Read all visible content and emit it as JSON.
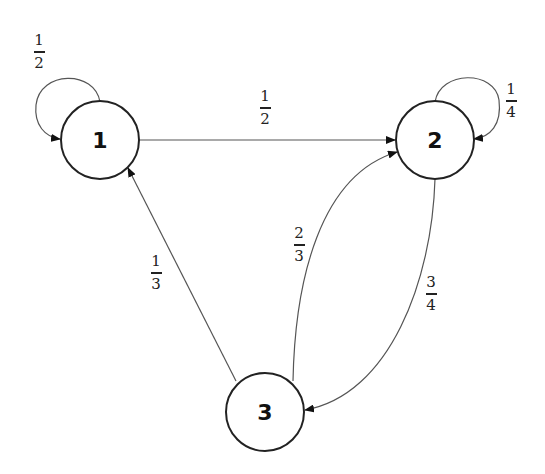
{
  "diagram": {
    "type": "markov-chain-state-diagram",
    "nodes": [
      {
        "id": "1",
        "label": "1"
      },
      {
        "id": "2",
        "label": "2"
      },
      {
        "id": "3",
        "label": "3"
      }
    ],
    "edges": [
      {
        "from": "1",
        "to": "1",
        "num": "1",
        "den": "2"
      },
      {
        "from": "1",
        "to": "2",
        "num": "1",
        "den": "2"
      },
      {
        "from": "2",
        "to": "2",
        "num": "1",
        "den": "4"
      },
      {
        "from": "2",
        "to": "3",
        "num": "3",
        "den": "4"
      },
      {
        "from": "3",
        "to": "2",
        "num": "2",
        "den": "3"
      },
      {
        "from": "3",
        "to": "1",
        "num": "1",
        "den": "3"
      }
    ],
    "colors": {
      "stroke": "#222222",
      "edge": "#444444",
      "background": "#ffffff"
    }
  }
}
